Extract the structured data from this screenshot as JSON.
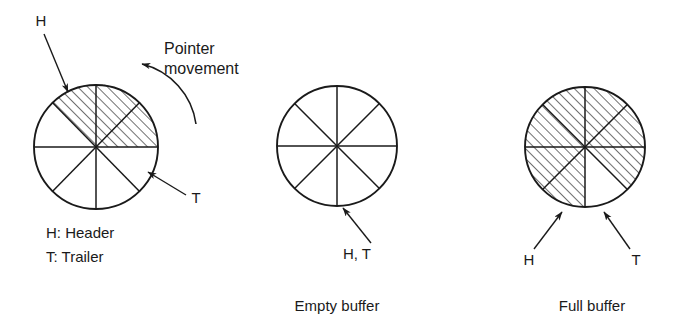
{
  "figure": {
    "background_color": "#ffffff",
    "ink_color": "#1a1a1a",
    "sector_count": 8
  },
  "legend": {
    "header_line": "H:  Header",
    "trailer_line": "T:  Trailer"
  },
  "annotations": {
    "pointer_movement_line1": "Pointer",
    "pointer_movement_line2": "movement",
    "header_letter": "H",
    "trailer_letter": "T",
    "empty_both_letters": "H, T"
  },
  "diagrams": [
    {
      "id": "partially-filled-buffer",
      "caption": "",
      "center": {
        "x": 96,
        "y": 147
      },
      "radius": 62,
      "hatched_sectors": [
        0,
        1,
        2
      ],
      "hatched_sector_count": 3,
      "labels": [
        {
          "name": "header-label",
          "text": "H",
          "x": 47,
          "y": 22
        },
        {
          "name": "trailer-label",
          "text": "T",
          "x": 196,
          "y": 199
        }
      ]
    },
    {
      "id": "empty-buffer",
      "caption": "Empty buffer",
      "center": {
        "x": 337,
        "y": 146
      },
      "radius": 60,
      "hatched_sectors": [],
      "hatched_sector_count": 0,
      "labels": [
        {
          "name": "header-trailer-label",
          "text": "H, T",
          "x": 338,
          "y": 265
        }
      ]
    },
    {
      "id": "full-buffer",
      "caption": "Full buffer",
      "center": {
        "x": 585,
        "y": 147
      },
      "radius": 60,
      "hatched_sectors": [
        0,
        1,
        2,
        3,
        4,
        5,
        7
      ],
      "hatched_sector_count": 7,
      "labels": [
        {
          "name": "header-label",
          "text": "H",
          "x": 539,
          "y": 265
        },
        {
          "name": "trailer-label",
          "text": "T",
          "x": 625,
          "y": 265
        }
      ]
    }
  ],
  "captions": {
    "empty_buffer": "Empty buffer",
    "full_buffer": "Full buffer"
  }
}
